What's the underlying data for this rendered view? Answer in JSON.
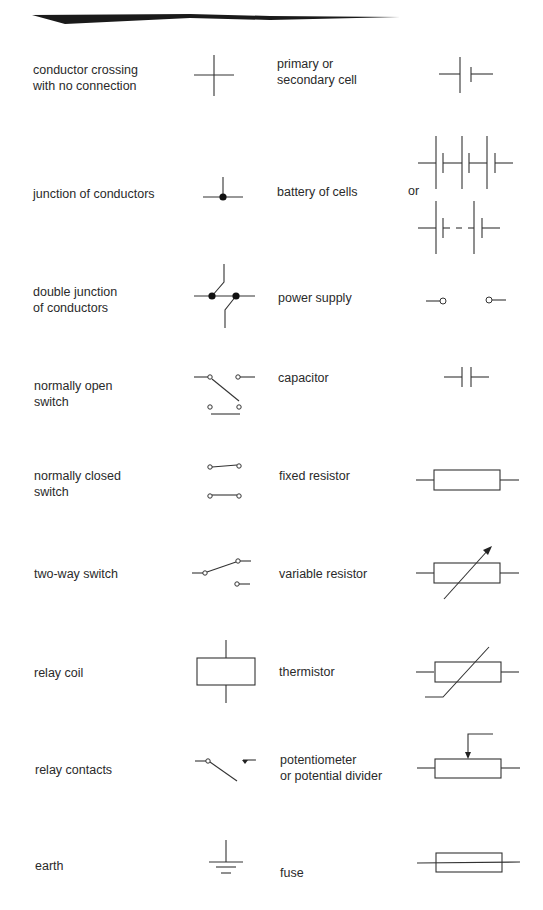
{
  "or_label": "or",
  "left_column": [
    {
      "id": "conductor-crossing",
      "label": "conductor crossing\nwith no connection"
    },
    {
      "id": "junction",
      "label": "junction of conductors"
    },
    {
      "id": "double-junction",
      "label": "double junction\nof conductors"
    },
    {
      "id": "normally-open-switch",
      "label": "normally open\nswitch"
    },
    {
      "id": "normally-closed-switch",
      "label": "normally closed\nswitch"
    },
    {
      "id": "two-way-switch",
      "label": "two-way switch"
    },
    {
      "id": "relay-coil",
      "label": "relay coil"
    },
    {
      "id": "relay-contacts",
      "label": "relay contacts"
    },
    {
      "id": "earth",
      "label": "earth"
    }
  ],
  "right_column": [
    {
      "id": "cell",
      "label": "primary or\nsecondary cell"
    },
    {
      "id": "battery",
      "label": "battery of cells"
    },
    {
      "id": "power-supply",
      "label": "power supply"
    },
    {
      "id": "capacitor",
      "label": "capacitor"
    },
    {
      "id": "fixed-resistor",
      "label": "fixed resistor"
    },
    {
      "id": "variable-resistor",
      "label": "variable resistor"
    },
    {
      "id": "thermistor",
      "label": "thermistor"
    },
    {
      "id": "potentiometer",
      "label": "potentiometer\nor potential divider"
    },
    {
      "id": "fuse",
      "label": "fuse"
    }
  ],
  "colors": {
    "line": "#333333",
    "text": "#2a2a2a",
    "banner": "#1a1a1a",
    "background": "#ffffff"
  }
}
